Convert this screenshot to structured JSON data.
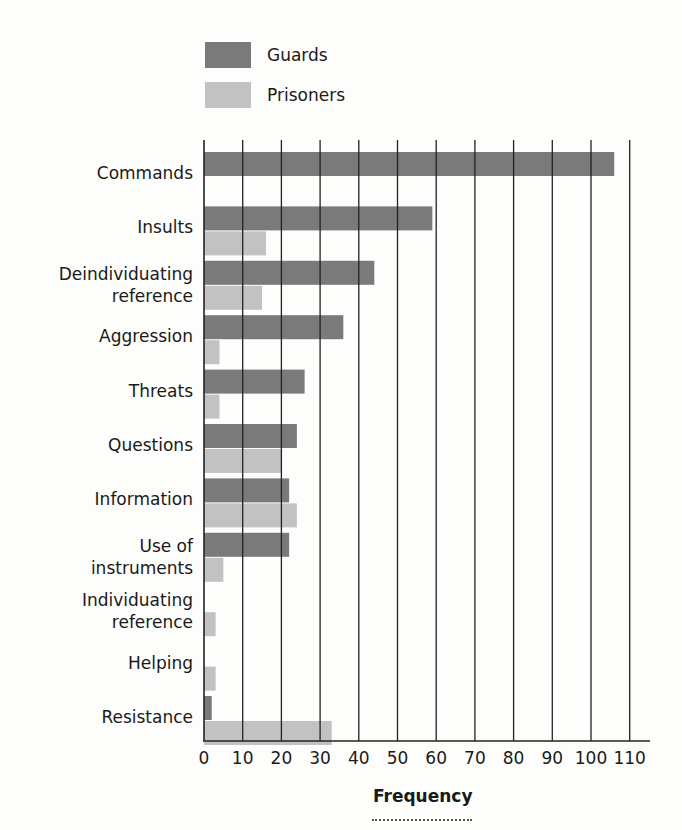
{
  "chart_data": {
    "type": "bar",
    "orientation": "horizontal",
    "title": "",
    "xlabel": "Frequency",
    "ylabel": "",
    "xlim": [
      0,
      110
    ],
    "x_ticks": [
      0,
      10,
      20,
      30,
      40,
      50,
      60,
      70,
      80,
      90,
      100,
      110
    ],
    "grid": "vertical lines at every tick",
    "legend_position": "top-left, above plot",
    "categories": [
      "Commands",
      "Insults",
      "Deindividuating reference",
      "Aggression",
      "Threats",
      "Questions",
      "Information",
      "Use of instruments",
      "Individuating reference",
      "Helping",
      "Resistance"
    ],
    "category_lines": [
      [
        "Commands"
      ],
      [
        "Insults"
      ],
      [
        "Deindividuating",
        "reference"
      ],
      [
        "Aggression"
      ],
      [
        "Threats"
      ],
      [
        "Questions"
      ],
      [
        "Information"
      ],
      [
        "Use of",
        "instruments"
      ],
      [
        "Individuating",
        "reference"
      ],
      [
        "Helping"
      ],
      [
        "Resistance"
      ]
    ],
    "series": [
      {
        "name": "Guards",
        "color": "#7a7a7a",
        "values": [
          106,
          59,
          44,
          36,
          26,
          24,
          22,
          22,
          0,
          0,
          2
        ]
      },
      {
        "name": "Prisoners",
        "color": "#c2c2c2",
        "values": [
          0,
          16,
          15,
          4,
          4,
          20,
          24,
          5,
          3,
          3,
          33
        ]
      }
    ]
  },
  "legend": {
    "guards_label": "Guards",
    "prisoners_label": "Prisoners"
  }
}
